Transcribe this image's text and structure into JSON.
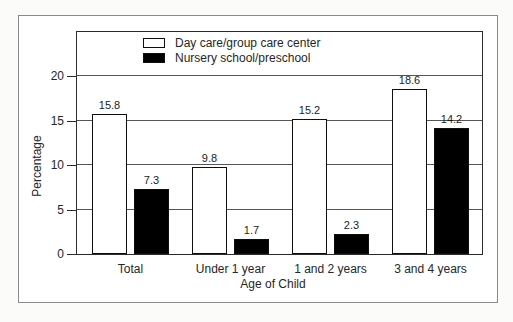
{
  "figure": {
    "background": "#fbfbf9",
    "frame_fill": "#ffffff",
    "frame_border": "#8a8a8a",
    "plot_border": "#2b2b2b",
    "gridline_color": "#555555",
    "bar_border": "#0f0f0f"
  },
  "chart_data": {
    "type": "bar",
    "title": "",
    "categories": [
      "Total",
      "Under 1 year",
      "1 and 2 years",
      "3 and 4 years"
    ],
    "series": [
      {
        "name": "Day care/group care center",
        "fill": "#ffffff",
        "values": [
          15.8,
          9.8,
          15.2,
          18.6
        ]
      },
      {
        "name": "Nursery school/preschool",
        "fill": "#000000",
        "values": [
          7.3,
          1.7,
          2.3,
          14.2
        ]
      }
    ],
    "xlabel": "Age of Child",
    "ylabel": "Percentage",
    "ylim": [
      0,
      25
    ],
    "yticks": [
      0,
      5,
      10,
      15,
      20
    ],
    "grid": true,
    "legend_position": "top-inside",
    "value_labels_shown": true
  }
}
